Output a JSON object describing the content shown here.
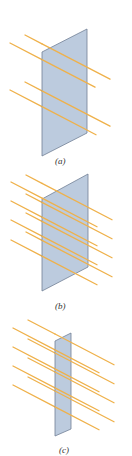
{
  "figure": {
    "colors": {
      "plate_fill": "#b9c9dd",
      "plate_edge": "#6b7a90",
      "ray": "#efb14a",
      "ray_head": "#e9a43a",
      "label": "#333333"
    },
    "panels": [
      {
        "id": "a",
        "label": "(a)",
        "ray_count": 4,
        "plate": "wide, tilted"
      },
      {
        "id": "b",
        "label": "(b)",
        "ray_count": 8,
        "plate": "wide, tilted"
      },
      {
        "id": "c",
        "label": "(c)",
        "ray_count": 8,
        "plate": "narrow"
      }
    ]
  }
}
